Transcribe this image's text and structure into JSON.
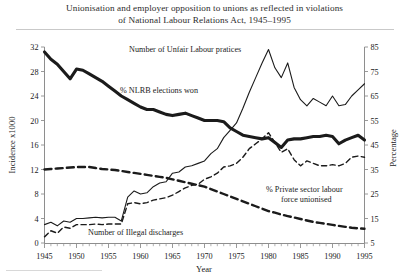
{
  "figure": {
    "title_line1": "Unionisation and employer opposition to unions as reflected in violations",
    "title_line2": "of National Labour Relations Act, 1945–1995"
  },
  "chart_data": {
    "type": "line",
    "title": "Unionisation and employer opposition to unions as reflected in violations of National Labour Relations Act, 1945–1995",
    "xlabel": "Year",
    "ylabel": "Incidence x1000",
    "ylabel_right": "Percentage",
    "xlim": [
      1945,
      1995
    ],
    "ylim": [
      0,
      32
    ],
    "ylim_right": [
      5,
      85
    ],
    "grid": false,
    "legend": "inline-annotations",
    "xticks": [
      1945,
      1950,
      1955,
      1960,
      1965,
      1970,
      1975,
      1980,
      1985,
      1990,
      1995
    ],
    "xticks_minor_step": 1,
    "yticks_left": [
      0,
      4,
      8,
      12,
      16,
      20,
      24,
      28,
      32
    ],
    "yticks_right": [
      5,
      15,
      25,
      35,
      45,
      55,
      65,
      75,
      85
    ],
    "x": [
      1945,
      1946,
      1947,
      1948,
      1949,
      1950,
      1951,
      1952,
      1953,
      1954,
      1955,
      1956,
      1957,
      1958,
      1959,
      1960,
      1961,
      1962,
      1963,
      1964,
      1965,
      1966,
      1967,
      1968,
      1969,
      1970,
      1971,
      1972,
      1973,
      1974,
      1975,
      1976,
      1977,
      1978,
      1979,
      1980,
      1981,
      1982,
      1983,
      1984,
      1985,
      1986,
      1987,
      1988,
      1989,
      1990,
      1991,
      1992,
      1993,
      1994,
      1995
    ],
    "series": [
      {
        "name": "% NLRB elections won",
        "axis": "right",
        "units": "percent",
        "style": "thick-solid",
        "label_text": "% NLRB elections won",
        "values": [
          83,
          80,
          78,
          75,
          72,
          76,
          75.5,
          74,
          72.5,
          71,
          69,
          67,
          65,
          63.5,
          62,
          60.5,
          59.5,
          59.5,
          58.5,
          57.5,
          57,
          57.5,
          58,
          57,
          56,
          55,
          55,
          55,
          54.5,
          52,
          50.5,
          49,
          48.5,
          48,
          47.5,
          48,
          46,
          44,
          47,
          47.5,
          47.5,
          48,
          48.5,
          48.5,
          49,
          48.5,
          45.5,
          47,
          48,
          49,
          47
        ]
      },
      {
        "name": "Number of Unfair Labour pratices",
        "axis": "left",
        "units": "thousands",
        "style": "thin-solid",
        "label_text": "Number of Unfair Labour pratices",
        "values": [
          3,
          3.4,
          2.8,
          3.6,
          3.4,
          4,
          4,
          4.1,
          4.2,
          4.1,
          4.2,
          4.2,
          3.6,
          7.5,
          8.5,
          8,
          8.2,
          9.2,
          9.8,
          10,
          11.4,
          11.6,
          12.4,
          12.6,
          13,
          13.4,
          14.6,
          15.4,
          17.2,
          18.4,
          19.6,
          22,
          24.6,
          27,
          29.4,
          31.6,
          28.6,
          27,
          29.4,
          25.4,
          23.4,
          22.4,
          23.6,
          23,
          22.4,
          24,
          22.4,
          22.6,
          24,
          25,
          26
        ]
      },
      {
        "name": "Number of Illegal discharges",
        "axis": "left",
        "units": "thousands",
        "style": "thin-dashed",
        "label_text": "Number of Illegal discharges",
        "values": [
          1,
          2,
          1.6,
          2.6,
          2.4,
          3,
          3,
          3,
          3.1,
          3,
          3.1,
          3.1,
          3.1,
          6.4,
          6.6,
          6.4,
          6.6,
          7,
          7.2,
          7.4,
          7.8,
          8.4,
          9,
          9.4,
          9.6,
          10.4,
          10.8,
          11.4,
          12.4,
          12.6,
          13,
          14,
          15.4,
          16.2,
          17,
          18,
          16.4,
          14.8,
          15.4,
          13.6,
          12.6,
          13.4,
          13,
          12.6,
          12.6,
          12.8,
          12.6,
          13,
          14,
          14.2,
          14
        ]
      },
      {
        "name": "% Private sector labour force unionised",
        "axis": "right",
        "units": "percent",
        "style": "heavy-dashed",
        "label_text_line1": "% Private sector labour",
        "label_text_line2": "force unionised",
        "values": [
          35,
          35.2,
          35.4,
          35.6,
          35.8,
          36,
          36,
          36,
          35.6,
          35.2,
          35,
          34.8,
          34.4,
          34,
          33.6,
          33.2,
          32.8,
          32.4,
          32,
          31.6,
          31,
          30.4,
          29.8,
          29.2,
          28.6,
          28,
          27,
          26,
          25,
          24,
          23,
          22,
          21,
          20,
          19,
          18,
          17.4,
          16.6,
          16,
          15.4,
          14.8,
          14.2,
          13.6,
          13.2,
          12.8,
          12.4,
          12,
          11.6,
          11.2,
          11,
          10.8
        ]
      }
    ]
  },
  "axes": {
    "left_title": "Incidence x1000",
    "right_title": "Percentage",
    "x_title": "Year"
  }
}
